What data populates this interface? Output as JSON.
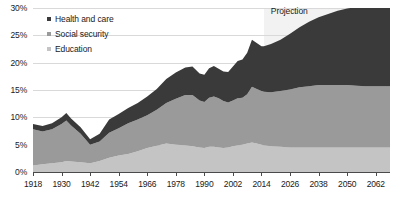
{
  "chart_data": {
    "type": "area",
    "stacked": true,
    "title": "",
    "xlabel": "",
    "ylabel": "",
    "ylim": [
      0,
      30
    ],
    "xlim": [
      1918,
      2068
    ],
    "grid": true,
    "y_ticks": [
      "0%",
      "5%",
      "10%",
      "15%",
      "20%",
      "25%",
      "30%"
    ],
    "y_tick_values": [
      0,
      5,
      10,
      15,
      20,
      25,
      30
    ],
    "x_ticks": [
      "1918",
      "1930",
      "1942",
      "1954",
      "1966",
      "1978",
      "1990",
      "2002",
      "2014",
      "2026",
      "2038",
      "2050",
      "2062"
    ],
    "x_tick_values": [
      1918,
      1930,
      1942,
      1954,
      1966,
      1978,
      1990,
      2002,
      2014,
      2026,
      2038,
      2050,
      2062
    ],
    "legend_position": "top-left",
    "annotations": [
      {
        "text": "Projection",
        "start_year": 2015,
        "end_year": 2068
      }
    ],
    "x": [
      1918,
      1922,
      1926,
      1930,
      1932,
      1934,
      1938,
      1942,
      1946,
      1950,
      1954,
      1958,
      1962,
      1966,
      1970,
      1974,
      1978,
      1982,
      1985,
      1988,
      1990,
      1992,
      1994,
      1996,
      1998,
      2000,
      2002,
      2004,
      2006,
      2008,
      2010,
      2012,
      2014,
      2015,
      2018,
      2022,
      2026,
      2030,
      2034,
      2038,
      2042,
      2046,
      2050,
      2054,
      2058,
      2062,
      2066,
      2068
    ],
    "series": [
      {
        "name": "Education",
        "color": "#c4c4c4",
        "values": [
          1.2,
          1.4,
          1.6,
          1.8,
          2.0,
          1.9,
          1.8,
          1.6,
          2.0,
          2.6,
          3.0,
          3.3,
          3.8,
          4.4,
          4.8,
          5.2,
          5.0,
          4.9,
          4.7,
          4.5,
          4.4,
          4.6,
          4.6,
          4.5,
          4.4,
          4.5,
          4.7,
          4.9,
          5.0,
          5.2,
          5.4,
          5.2,
          5.0,
          4.9,
          4.7,
          4.6,
          4.5,
          4.5,
          4.5,
          4.5,
          4.5,
          4.5,
          4.5,
          4.5,
          4.5,
          4.5,
          4.5,
          4.5
        ]
      },
      {
        "name": "Social security",
        "color": "#9a9a9a",
        "values": [
          6.6,
          6.0,
          6.2,
          7.0,
          7.4,
          6.6,
          5.2,
          3.4,
          3.6,
          4.6,
          5.0,
          5.6,
          5.8,
          6.0,
          6.6,
          7.4,
          8.4,
          9.2,
          9.4,
          8.6,
          8.4,
          9.0,
          9.2,
          9.0,
          8.6,
          8.2,
          8.4,
          8.6,
          8.6,
          9.0,
          10.2,
          10.0,
          9.8,
          9.8,
          9.9,
          10.2,
          10.6,
          11.0,
          11.2,
          11.4,
          11.4,
          11.4,
          11.4,
          11.3,
          11.2,
          11.2,
          11.2,
          11.2
        ]
      },
      {
        "name": "Health and care",
        "color": "#3a3a3a",
        "values": [
          1.0,
          1.0,
          1.1,
          1.2,
          1.4,
          1.3,
          1.2,
          1.0,
          1.4,
          2.4,
          2.6,
          2.8,
          3.0,
          3.4,
          3.8,
          4.4,
          4.8,
          5.0,
          5.2,
          4.9,
          5.0,
          5.4,
          5.6,
          5.4,
          5.4,
          5.6,
          6.2,
          6.8,
          7.0,
          7.6,
          8.6,
          8.4,
          8.2,
          8.3,
          8.8,
          9.4,
          10.2,
          11.0,
          11.8,
          12.4,
          13.0,
          13.6,
          14.0,
          14.4,
          14.6,
          14.8,
          15.0,
          15.0
        ]
      }
    ]
  },
  "legend": {
    "items": [
      {
        "label": "Health and care"
      },
      {
        "label": "Social security"
      },
      {
        "label": "Education"
      }
    ]
  },
  "projection": {
    "label": "Projection"
  }
}
